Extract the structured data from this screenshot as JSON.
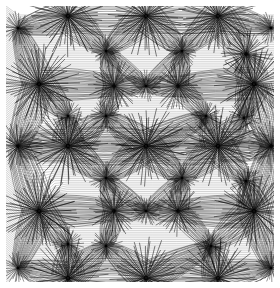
{
  "artwork": {
    "title": "Radiating Star Lattice",
    "type": "generative-line-art",
    "canvas": {
      "width": 280,
      "height": 288
    },
    "background_color": "#ffffff",
    "margin": {
      "left": 6,
      "top": 6,
      "right": 6,
      "bottom": 6
    },
    "plot_area": {
      "x": 6,
      "y": 6,
      "width": 268,
      "height": 276
    },
    "stroke": {
      "color": "#000000",
      "width": 0.42,
      "opacity": 0.92
    },
    "render": {
      "rays_per_node_base": 46,
      "ray_length_scale": 1.0,
      "curvature": 0.34,
      "jitter_seed": 20240617,
      "angular_jitter": 0.055,
      "radial_jitter": 0.09
    }
  },
  "chart_data": {
    "type": "scatter",
    "xlabel": "",
    "ylabel": "",
    "xlim": [
      0,
      268
    ],
    "ylim": [
      0,
      276
    ],
    "grid": false,
    "legend": null,
    "node_size_classes": {
      "major": {
        "radius": 34,
        "rays": 62,
        "weight": 1.0
      },
      "medium": {
        "radius": 22,
        "rays": 48,
        "weight": 0.75
      },
      "minor": {
        "radius": 14,
        "rays": 34,
        "weight": 0.52
      }
    },
    "nodes": [
      {
        "x": 62,
        "y": 10,
        "class": "major"
      },
      {
        "x": 140,
        "y": 10,
        "class": "major"
      },
      {
        "x": 212,
        "y": 10,
        "class": "major"
      },
      {
        "x": 12,
        "y": 22,
        "class": "minor"
      },
      {
        "x": 265,
        "y": 22,
        "class": "minor"
      },
      {
        "x": 100,
        "y": 45,
        "class": "minor"
      },
      {
        "x": 176,
        "y": 45,
        "class": "minor"
      },
      {
        "x": 240,
        "y": 48,
        "class": "medium"
      },
      {
        "x": 33,
        "y": 78,
        "class": "major"
      },
      {
        "x": 108,
        "y": 80,
        "class": "medium"
      },
      {
        "x": 140,
        "y": 80,
        "class": "minor"
      },
      {
        "x": 172,
        "y": 80,
        "class": "medium"
      },
      {
        "x": 248,
        "y": 78,
        "class": "major"
      },
      {
        "x": 62,
        "y": 110,
        "class": "minor"
      },
      {
        "x": 100,
        "y": 110,
        "class": "minor"
      },
      {
        "x": 200,
        "y": 110,
        "class": "minor"
      },
      {
        "x": 238,
        "y": 112,
        "class": "minor"
      },
      {
        "x": 12,
        "y": 140,
        "class": "medium"
      },
      {
        "x": 62,
        "y": 140,
        "class": "major"
      },
      {
        "x": 140,
        "y": 140,
        "class": "major"
      },
      {
        "x": 212,
        "y": 140,
        "class": "major"
      },
      {
        "x": 265,
        "y": 140,
        "class": "medium"
      },
      {
        "x": 100,
        "y": 172,
        "class": "minor"
      },
      {
        "x": 176,
        "y": 172,
        "class": "minor"
      },
      {
        "x": 240,
        "y": 175,
        "class": "minor"
      },
      {
        "x": 33,
        "y": 205,
        "class": "major"
      },
      {
        "x": 108,
        "y": 205,
        "class": "medium"
      },
      {
        "x": 140,
        "y": 205,
        "class": "minor"
      },
      {
        "x": 172,
        "y": 205,
        "class": "medium"
      },
      {
        "x": 248,
        "y": 205,
        "class": "major"
      },
      {
        "x": 62,
        "y": 238,
        "class": "minor"
      },
      {
        "x": 100,
        "y": 240,
        "class": "minor"
      },
      {
        "x": 205,
        "y": 240,
        "class": "minor"
      },
      {
        "x": 12,
        "y": 262,
        "class": "minor"
      },
      {
        "x": 62,
        "y": 272,
        "class": "major"
      },
      {
        "x": 140,
        "y": 272,
        "class": "major"
      },
      {
        "x": 212,
        "y": 272,
        "class": "major"
      },
      {
        "x": 265,
        "y": 262,
        "class": "minor"
      }
    ],
    "connections": [
      [
        0,
        1
      ],
      [
        1,
        2
      ],
      [
        0,
        3
      ],
      [
        2,
        4
      ],
      [
        0,
        5
      ],
      [
        1,
        5
      ],
      [
        1,
        6
      ],
      [
        2,
        6
      ],
      [
        2,
        7
      ],
      [
        3,
        8
      ],
      [
        5,
        9
      ],
      [
        5,
        10
      ],
      [
        6,
        10
      ],
      [
        6,
        11
      ],
      [
        7,
        12
      ],
      [
        8,
        9
      ],
      [
        9,
        10
      ],
      [
        10,
        11
      ],
      [
        11,
        12
      ],
      [
        8,
        13
      ],
      [
        9,
        14
      ],
      [
        11,
        15
      ],
      [
        12,
        16
      ],
      [
        8,
        17
      ],
      [
        13,
        18
      ],
      [
        14,
        18
      ],
      [
        14,
        19
      ],
      [
        15,
        19
      ],
      [
        15,
        20
      ],
      [
        16,
        20
      ],
      [
        12,
        21
      ],
      [
        17,
        18
      ],
      [
        18,
        19
      ],
      [
        19,
        20
      ],
      [
        20,
        21
      ],
      [
        18,
        22
      ],
      [
        19,
        22
      ],
      [
        19,
        23
      ],
      [
        20,
        23
      ],
      [
        20,
        24
      ],
      [
        17,
        25
      ],
      [
        22,
        26
      ],
      [
        22,
        27
      ],
      [
        23,
        27
      ],
      [
        23,
        28
      ],
      [
        24,
        29
      ],
      [
        21,
        29
      ],
      [
        25,
        26
      ],
      [
        26,
        27
      ],
      [
        27,
        28
      ],
      [
        28,
        29
      ],
      [
        25,
        30
      ],
      [
        26,
        31
      ],
      [
        28,
        32
      ],
      [
        29,
        32
      ],
      [
        25,
        33
      ],
      [
        30,
        34
      ],
      [
        31,
        34
      ],
      [
        31,
        35
      ],
      [
        32,
        35
      ],
      [
        32,
        36
      ],
      [
        29,
        37
      ],
      [
        34,
        35
      ],
      [
        35,
        36
      ],
      [
        33,
        34
      ],
      [
        36,
        37
      ]
    ]
  }
}
